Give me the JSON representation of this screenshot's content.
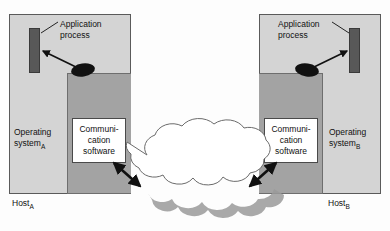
{
  "diagram": {
    "colors": {
      "host_fill": "#d4d4d4",
      "comm_band_fill": "#a3a3a3",
      "comm_box_fill": "#ffffff",
      "process_fill": "#585858",
      "cloud_fill": "#ffffff",
      "cloud_stroke": "#666666",
      "cloud_shadow": "#9a9a9a",
      "outline": "#5a5a5a",
      "text": "#111111",
      "arrow": "#111111"
    },
    "hosts": [
      {
        "id": "a",
        "host_label": "Host",
        "host_subscript": "A",
        "os_label_line1": "Operating",
        "os_label_line2": "system",
        "os_subscript": "A",
        "app_label_line1": "Application",
        "app_label_line2": "process",
        "comm_line1": "Communi-",
        "comm_line2": "cation",
        "comm_line3": "software"
      },
      {
        "id": "b",
        "host_label": "Host",
        "host_subscript": "B",
        "os_label_line1": "Operating",
        "os_label_line2": "system",
        "os_subscript": "B",
        "app_label_line1": "Application",
        "app_label_line2": "process",
        "comm_line1": "Communi-",
        "comm_line2": "cation",
        "comm_line3": "software"
      }
    ],
    "network": {
      "label": "Network",
      "shape": "cloud"
    }
  }
}
